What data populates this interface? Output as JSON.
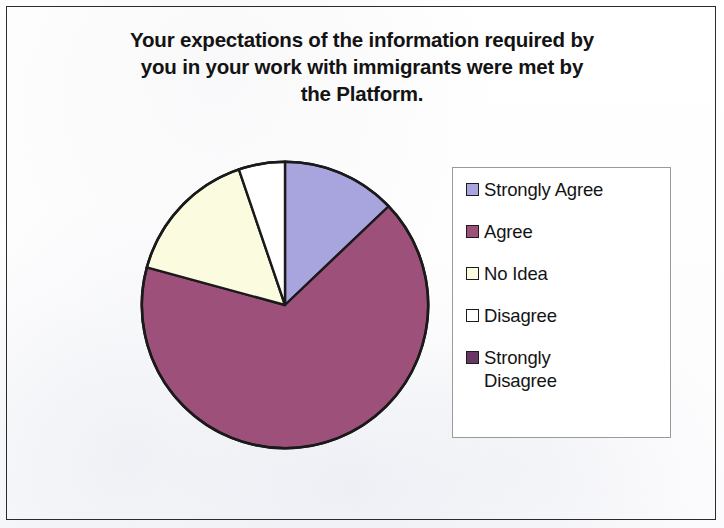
{
  "chart_data": {
    "type": "pie",
    "title": "Your expectations of the information required by you in your work with immigrants were met by the Platform.",
    "categories": [
      "Strongly Agree",
      "Agree",
      "No Idea",
      "Disagree",
      "Strongly Disagree"
    ],
    "values": [
      12.9,
      66.3,
      15.6,
      5.2,
      0
    ],
    "value_unit": "percent",
    "colors": [
      "#a8a4dd",
      "#9d5079",
      "#fbfbe0",
      "#ffffff",
      "#6a3663"
    ],
    "slice_order": "clockwise from 12 o'clock",
    "slice_angles_deg": [
      46.4,
      238.8,
      56.0,
      18.8,
      0
    ],
    "legend_position": "right",
    "grid": false,
    "xlabel": "",
    "ylabel": "",
    "data_labels_shown": false,
    "outline_color": "#1a1a1a"
  },
  "title": {
    "line1": "Your expectations of the information required by",
    "line2": "you in your work with immigrants were met by",
    "line3": "the Platform."
  },
  "legend": {
    "items": [
      {
        "label": "Strongly Agree",
        "color": "#a8a4dd"
      },
      {
        "label": "Agree",
        "color": "#9d5079"
      },
      {
        "label": "No Idea",
        "color": "#fbfbe0"
      },
      {
        "label": "Disagree",
        "color": "#ffffff"
      },
      {
        "label": "Strongly\nDisagree",
        "color": "#6a3663"
      }
    ]
  }
}
